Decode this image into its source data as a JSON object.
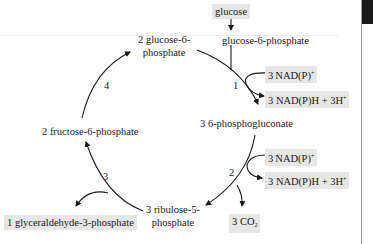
{
  "diagram": {
    "nodes": {
      "glucose": "glucose",
      "glucose_6_phosphate": "glucose-6-phosphate",
      "two_glucose_6_phosphate_line1": "2 glucose-6-",
      "two_glucose_6_phosphate_line2": "phosphate",
      "six_phosphogluconate": "3 6-phosphogluconate",
      "ribulose_line1": "3 ribulose-5-",
      "ribulose_line2": "phosphate",
      "fructose_6_phosphate": "2 fructose-6-phosphate",
      "glyceraldehyde_3_phosphate": "1 glyceraldehyde-3-phosphate"
    },
    "cofactors": {
      "step1_in": {
        "coef": "3",
        "base": "NAD(P)",
        "sup": "+"
      },
      "step1_out": {
        "text": "3 NAD(P)H + 3H",
        "sup": "+"
      },
      "step2_in": {
        "coef": "3",
        "base": "NAD(P)",
        "sup": "+"
      },
      "step2_out": {
        "text": "3 NAD(P)H + 3H",
        "sup": "+"
      },
      "co2": {
        "text": "3 CO",
        "sub": "2"
      }
    },
    "steps": [
      "1",
      "2",
      "3",
      "4"
    ],
    "colors": {
      "highlight_box": "#e6e6e6",
      "arrow": "#1a1a1a",
      "text": "#1a1a1a"
    }
  }
}
